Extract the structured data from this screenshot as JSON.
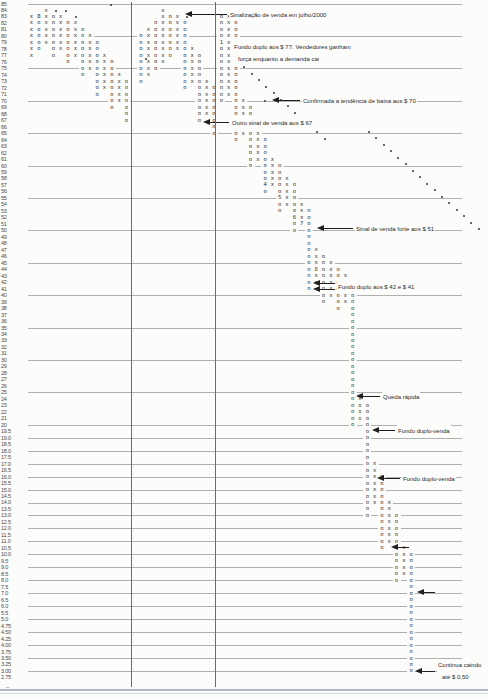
{
  "page": {
    "background": "#fcfcfb",
    "glyph_color": "#2e2e2e",
    "grid_color": "#b0b0b0",
    "divider_color": "#6a6a6a",
    "annotation_color": "#2a2a2a"
  },
  "axis": {
    "labels": [
      "85",
      "84",
      "83",
      "82",
      "81",
      "80",
      "79",
      "78",
      "77",
      "76",
      "75",
      "74",
      "73",
      "72",
      "71",
      "70",
      "69",
      "68",
      "67",
      "66",
      "65",
      "64",
      "63",
      "62",
      "61",
      "60",
      "59",
      "58",
      "57",
      "56",
      "55",
      "54",
      "53",
      "52",
      "51",
      "50",
      "49",
      "48",
      "47",
      "46",
      "45",
      "44",
      "43",
      "42",
      "41",
      "40",
      "39",
      "38",
      "37",
      "36",
      "35",
      "34",
      "33",
      "32",
      "31",
      "30",
      "29",
      "28",
      "27",
      "26",
      "25",
      "24",
      "23",
      "22",
      "21",
      "20",
      "19.5",
      "19.0",
      "18.5",
      "18.0",
      "17.5",
      "17.0",
      "16.5",
      "16.0",
      "15.5",
      "15.0",
      "14.5",
      "14.0",
      "13.5",
      "13.0",
      "12.5",
      "12.0",
      "11.5",
      "11.0",
      "10.5",
      "10.0",
      "9.5",
      "9.0",
      "8.5",
      "8.0",
      "7.5",
      "7.0",
      "6.5",
      "6.0",
      "5.5",
      "5.0",
      "4.75",
      "4.50",
      "4.25",
      "4.00",
      "3.75",
      "3.50",
      "3.25",
      "3.00",
      "2.75"
    ],
    "bottom_dash": "–"
  },
  "chart_data": {
    "type": "point-and-figure",
    "title": "",
    "ylabel": "Preço ($)",
    "price_top": 85,
    "price_bottom": 2.75,
    "box_size_rules": "1 ponto acima de 20; 0.5 entre 5 e 20; 0.25 abaixo de 5",
    "gridline_prices": [
      85,
      80,
      75,
      70,
      65,
      60,
      55,
      50,
      45,
      40,
      35,
      30,
      25,
      20,
      19,
      18,
      17,
      16,
      15,
      14,
      13,
      12,
      11,
      10,
      9,
      8,
      7,
      6,
      5,
      4.5,
      4,
      3.5,
      3
    ],
    "year_divider_cols_x": [
      131,
      215
    ],
    "columns": [
      {
        "col": 0,
        "type": "X",
        "top": 83,
        "bottom": 77
      },
      {
        "col": 1,
        "type": "O",
        "top": 83,
        "bottom": 78
      },
      {
        "col": 2,
        "type": "X",
        "top": 84,
        "bottom": 79
      },
      {
        "col": 3,
        "type": "O",
        "top": 83,
        "bottom": 77
      },
      {
        "col": 4,
        "type": "X",
        "top": 83,
        "bottom": 78
      },
      {
        "col": 5,
        "type": "O",
        "top": 82,
        "bottom": 76
      },
      {
        "col": 6,
        "type": "X",
        "top": 82,
        "bottom": 77
      },
      {
        "col": 7,
        "type": "O",
        "top": 81,
        "bottom": 74
      },
      {
        "col": 8,
        "type": "X",
        "top": 80,
        "bottom": 75
      },
      {
        "col": 9,
        "type": "O",
        "top": 79,
        "bottom": 71
      },
      {
        "col": 10,
        "type": "X",
        "top": 77,
        "bottom": 72
      },
      {
        "col": 11,
        "type": "O",
        "top": 76,
        "bottom": 69
      },
      {
        "col": 12,
        "type": "X",
        "top": 74,
        "bottom": 70
      },
      {
        "col": 13,
        "type": "O",
        "top": 73,
        "bottom": 67
      },
      {
        "col": 15,
        "type": "O",
        "top": 80,
        "bottom": 73
      },
      {
        "col": 16,
        "type": "X",
        "top": 81,
        "bottom": 74
      },
      {
        "col": 17,
        "type": "O",
        "top": 82,
        "bottom": 75
      },
      {
        "col": 18,
        "type": "X",
        "top": 84,
        "bottom": 76
      },
      {
        "col": 19,
        "type": "O",
        "top": 83,
        "bottom": 77
      },
      {
        "col": 20,
        "type": "X",
        "top": 83,
        "bottom": 78
      },
      {
        "col": 21,
        "type": "O",
        "top": 82,
        "bottom": 72
      },
      {
        "col": 22,
        "type": "X",
        "top": 78,
        "bottom": 73
      },
      {
        "col": 23,
        "type": "O",
        "top": 77,
        "bottom": 67
      },
      {
        "col": 24,
        "type": "X",
        "top": 73,
        "bottom": 68
      },
      {
        "col": 25,
        "type": "O",
        "top": 72,
        "bottom": 65
      },
      {
        "col": 26,
        "type": "O",
        "top": 83,
        "bottom": 70
      },
      {
        "col": 27,
        "type": "X",
        "top": 83,
        "bottom": 71
      },
      {
        "col": 28,
        "type": "O",
        "top": 82,
        "bottom": 64
      },
      {
        "col": 29,
        "type": "X",
        "top": 70,
        "bottom": 65
      },
      {
        "col": 30,
        "type": "O",
        "top": 69,
        "bottom": 60
      },
      {
        "col": 31,
        "type": "X",
        "top": 65,
        "bottom": 61
      },
      {
        "col": 32,
        "type": "O",
        "top": 64,
        "bottom": 56
      },
      {
        "col": 33,
        "type": "X",
        "top": 61,
        "bottom": 57
      },
      {
        "col": 34,
        "type": "O",
        "top": 60,
        "bottom": 53
      },
      {
        "col": 35,
        "type": "X",
        "top": 58,
        "bottom": 54
      },
      {
        "col": 36,
        "type": "O",
        "top": 57,
        "bottom": 50
      },
      {
        "col": 37,
        "type": "X",
        "top": 54,
        "bottom": 51
      },
      {
        "col": 38,
        "type": "O",
        "top": 53,
        "bottom": 41
      },
      {
        "col": 39,
        "type": "X",
        "top": 47,
        "bottom": 42
      },
      {
        "col": 40,
        "type": "O",
        "top": 46,
        "bottom": 39
      },
      {
        "col": 41,
        "type": "X",
        "top": 45,
        "bottom": 40
      },
      {
        "col": 42,
        "type": "O",
        "top": 44,
        "bottom": 38
      },
      {
        "col": 43,
        "type": "X",
        "top": 43,
        "bottom": 39
      },
      {
        "col": 44,
        "type": "O",
        "top": 40,
        "bottom": 20
      },
      {
        "col": 45,
        "type": "X",
        "top": 24,
        "bottom": 21
      },
      {
        "col": 46,
        "type": "O",
        "top": 23,
        "bottom": 13
      },
      {
        "col": 47,
        "type": "X",
        "top": 17,
        "bottom": 14
      },
      {
        "col": 48,
        "type": "O",
        "top": 16,
        "bottom": 10.5
      },
      {
        "col": 49,
        "type": "X",
        "top": 14,
        "bottom": 11
      },
      {
        "col": 50,
        "type": "O",
        "top": 13,
        "bottom": 8
      },
      {
        "col": 51,
        "type": "X",
        "top": 10.5,
        "bottom": 8.5
      },
      {
        "col": 52,
        "type": "O",
        "top": 10,
        "bottom": 3
      }
    ],
    "month_markers": [
      {
        "col": 1,
        "price": 83,
        "label": "B"
      },
      {
        "col": 26,
        "price": 79,
        "label": "1"
      },
      {
        "col": 28,
        "price": 78,
        "label": "2"
      },
      {
        "col": 30,
        "price": 67,
        "label": "3"
      },
      {
        "col": 32,
        "price": 57,
        "label": "4"
      },
      {
        "col": 34,
        "price": 55,
        "label": "5"
      },
      {
        "col": 36,
        "price": 52,
        "label": "6"
      },
      {
        "col": 37,
        "price": 51,
        "label": "7"
      },
      {
        "col": 39,
        "price": 44,
        "label": "8"
      }
    ],
    "trendlines": [
      {
        "start_x": 236,
        "start_y": 60,
        "steps": 12
      },
      {
        "start_x": 368,
        "start_y": 131,
        "steps": 17
      }
    ],
    "single_dots": [
      [
        55,
        10
      ],
      [
        65,
        10
      ],
      [
        75,
        16
      ],
      [
        110,
        4
      ],
      [
        186,
        16
      ],
      [
        252,
        16
      ],
      [
        264,
        100
      ],
      [
        145,
        58
      ]
    ],
    "annotations": [
      {
        "lines": [
          "Sinalização de venda em julho/2000"
        ],
        "tips": [
          [
            185,
            14
          ]
        ],
        "text": [
          229,
          14
        ]
      },
      {
        "lines": [
          "Fundo duplo aos $ 77. Vendedores ganham",
          "força enquanto a demanda cai"
        ],
        "tips": [],
        "text": [
          233,
          46
        ]
      },
      {
        "lines": [
          "Confirmada a tendência de baixa aos $ 70"
        ],
        "tips": [
          [
            272,
            100
          ]
        ],
        "text": [
          302,
          100
        ]
      },
      {
        "lines": [
          "Outro sinal de venda aos $ 67"
        ],
        "tips": [
          [
            203,
            122
          ]
        ],
        "text": [
          231,
          122
        ]
      },
      {
        "lines": [
          "Sinal de venda forte aos $ 51"
        ],
        "tips": [
          [
            317,
            228
          ]
        ],
        "text": [
          355,
          228
        ]
      },
      {
        "lines": [
          "Fundo duplo aos $ 42 e $ 41"
        ],
        "tips": [
          [
            313,
            283
          ],
          [
            313,
            289
          ]
        ],
        "text": [
          337,
          286
        ]
      },
      {
        "lines": [
          "Queda rápida"
        ],
        "tips": [
          [
            356,
            396
          ]
        ],
        "text": [
          382,
          396
        ]
      },
      {
        "lines": [
          "Fundo duplo-venda"
        ],
        "tips": [
          [
            372,
            430
          ]
        ],
        "text": [
          397,
          430
        ]
      },
      {
        "lines": [
          "Fundo duplo-venda"
        ],
        "tips": [
          [
            377,
            478
          ]
        ],
        "text": [
          402,
          478
        ]
      },
      {
        "lines": [],
        "tips": [
          [
            391,
            547
          ]
        ],
        "text": null
      },
      {
        "lines": [],
        "tips": [
          [
            417,
            592
          ]
        ],
        "text": null
      },
      {
        "lines": [
          "Continua caindo",
          "até $ 0,50"
        ],
        "tips": [
          [
            415,
            671
          ]
        ],
        "text": [
          437,
          664
        ]
      }
    ]
  }
}
